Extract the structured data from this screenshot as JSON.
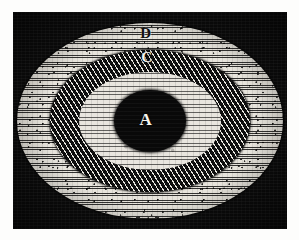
{
  "figure": {
    "caption": "",
    "background_color": "#fdfdfc",
    "plate_color": "#0b0b0b",
    "plate": {
      "x": 13,
      "y": 12,
      "width": 274,
      "height": 217
    },
    "regions": [
      {
        "id": "D",
        "label": "D",
        "role": "outer-light-ring",
        "texture": "fine horizontal line hatching",
        "fill_color": "#e7e4dc",
        "label_color": "#111111",
        "width": 266,
        "height": 196,
        "label_x": 146,
        "label_y": 33
      },
      {
        "id": "C",
        "label": "C",
        "role": "middle-dark-ring",
        "texture": "dense cross-hatched stipple / scale pattern",
        "fill_color": "#141414",
        "label_color": "#f6f4ee",
        "width": 200,
        "height": 142,
        "label_x": 147,
        "label_y": 57
      },
      {
        "id": "B",
        "label": "",
        "role": "inner-light-ring",
        "texture": "fine horizontal line hatching",
        "fill_color": "#e9e6df",
        "label_color": "#111111",
        "width": 142,
        "height": 98,
        "label_x": 146,
        "label_y": 80
      },
      {
        "id": "A",
        "label": "A",
        "role": "central-solid-disc",
        "texture": "solid black",
        "fill_color": "#090909",
        "label_color": "#f7f5ef",
        "width": 72,
        "height": 62,
        "label_x": 146,
        "label_y": 119
      }
    ]
  }
}
